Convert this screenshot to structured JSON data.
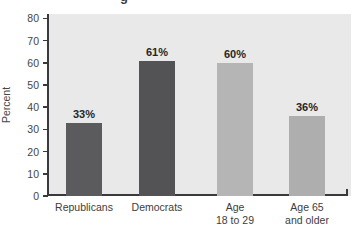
{
  "figure": {
    "clipped_title_fragment": "g"
  },
  "chart_data": {
    "type": "bar",
    "title": "",
    "ylabel": "Percent",
    "xlabel": "",
    "categories": [
      "Republicans",
      "Democrats",
      "Age 18 to 29",
      "Age 65 and older"
    ],
    "category_label_lines": [
      [
        "Republicans"
      ],
      [
        "Democrats"
      ],
      [
        "Age",
        "18 to 29"
      ],
      [
        "Age 65",
        "and older"
      ]
    ],
    "values": [
      33,
      61,
      60,
      36
    ],
    "value_labels": [
      "33%",
      "61%",
      "60%",
      "36%"
    ],
    "bar_colors": [
      "#5b5b5d",
      "#535355",
      "#b5b5b5",
      "#aeaeae"
    ],
    "ylim": [
      0,
      80
    ],
    "yticks": [
      0,
      10,
      20,
      30,
      40,
      50,
      60,
      70,
      80
    ],
    "grid": false,
    "legend": "none",
    "plot_bg_color": "#e9e9e9",
    "axis_color": "#3a3a3c"
  }
}
